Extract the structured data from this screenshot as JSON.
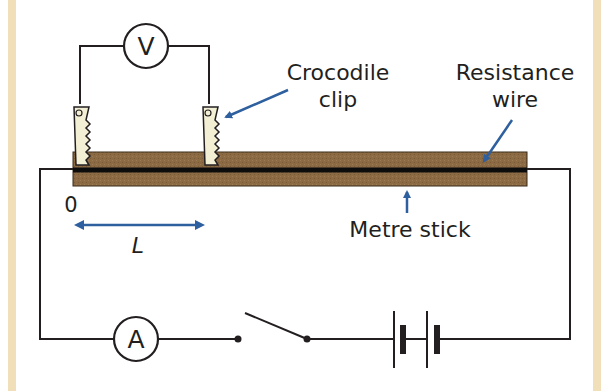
{
  "diagram": {
    "type": "circuit",
    "title": "",
    "labels": {
      "crocodile_clip_line1": "Crocodile",
      "crocodile_clip_line2": "clip",
      "resistance_wire_line1": "Resistance",
      "resistance_wire_line2": "wire",
      "metre_stick": "Metre stick",
      "zero": "0",
      "length": "L"
    },
    "meters": {
      "voltmeter": "V",
      "ammeter": "A"
    },
    "components": [
      "voltmeter",
      "crocodile clip",
      "crocodile clip",
      "resistance wire",
      "metre stick",
      "ammeter",
      "switch (open)",
      "battery (2 cells)"
    ],
    "colors": {
      "wire": "#231f20",
      "arrow": "#2e5f9e",
      "stick": "#8b6a44",
      "clip": "#f3efd4",
      "border": "#f1dfba"
    }
  }
}
